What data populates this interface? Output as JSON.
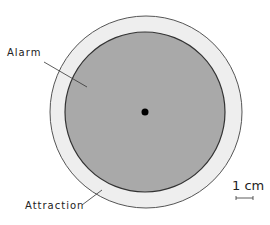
{
  "diagram": {
    "zones": [
      {
        "id": "attraction",
        "label": "Attraction",
        "fill": "#eeeeee",
        "stroke": "#444444"
      },
      {
        "id": "alarm",
        "label": "Alarm",
        "fill": "#a9a9a9",
        "stroke": "#333333"
      }
    ],
    "center_marker": {
      "fill": "#000000"
    },
    "scale_bar": {
      "label": "1 cm"
    },
    "labels": {
      "alarm": "Alarm",
      "attraction": "Attraction",
      "scale": "1 cm"
    }
  }
}
